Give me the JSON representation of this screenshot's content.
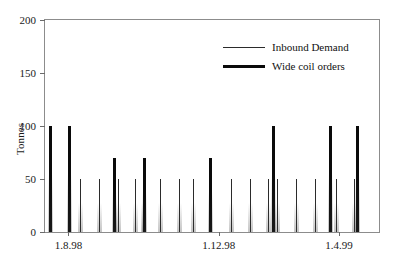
{
  "chart_data": {
    "type": "bar",
    "title": "",
    "xlabel": "",
    "ylabel": "Tonnes",
    "ylim": [
      0,
      200
    ],
    "yticks": [
      0,
      50,
      100,
      150,
      200
    ],
    "ytick_labels": [
      "0",
      "50",
      "100",
      "150",
      "200"
    ],
    "grid": false,
    "xtick_labels": [
      "1.8.98",
      "1.12.98",
      "1.4.99"
    ],
    "xtick_positions": [
      0.07,
      0.52,
      0.88
    ],
    "legend_position": "top-right",
    "series": [
      {
        "name": "Inbound Demand",
        "style": "thin-line",
        "points": [
          {
            "x": 0.105,
            "y": 50
          },
          {
            "x": 0.161,
            "y": 50
          },
          {
            "x": 0.218,
            "y": 50
          },
          {
            "x": 0.268,
            "y": 50
          },
          {
            "x": 0.292,
            "y": 50
          },
          {
            "x": 0.345,
            "y": 50
          },
          {
            "x": 0.402,
            "y": 50
          },
          {
            "x": 0.443,
            "y": 50
          },
          {
            "x": 0.556,
            "y": 50
          },
          {
            "x": 0.613,
            "y": 50
          },
          {
            "x": 0.667,
            "y": 50
          },
          {
            "x": 0.696,
            "y": 50
          },
          {
            "x": 0.75,
            "y": 50
          },
          {
            "x": 0.807,
            "y": 50
          },
          {
            "x": 0.872,
            "y": 50
          },
          {
            "x": 0.926,
            "y": 50
          }
        ]
      },
      {
        "name": "Wide coil orders",
        "style": "thick-line",
        "points": [
          {
            "x": 0.012,
            "y": 100
          },
          {
            "x": 0.068,
            "y": 100
          },
          {
            "x": 0.205,
            "y": 70
          },
          {
            "x": 0.292,
            "y": 70
          },
          {
            "x": 0.491,
            "y": 70
          },
          {
            "x": 0.679,
            "y": 100
          },
          {
            "x": 0.851,
            "y": 100
          },
          {
            "x": 0.932,
            "y": 100
          }
        ]
      }
    ]
  },
  "legend": {
    "items": [
      {
        "label": "Inbound Demand",
        "style": "thin"
      },
      {
        "label": "Wide coil orders",
        "style": "thick"
      }
    ]
  },
  "axes": {
    "y_title": "Tonnes"
  }
}
